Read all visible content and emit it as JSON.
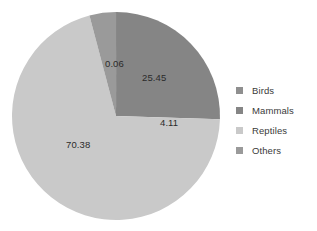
{
  "chart_data": {
    "type": "pie",
    "title": "",
    "subtitle": "",
    "xlabel": "",
    "ylabel": "",
    "grid": false,
    "legend_position": "right",
    "start_angle_deg": 0,
    "direction": "clockwise",
    "categories": [
      "Birds",
      "Mammals",
      "Reptiles",
      "Others"
    ],
    "values": [
      0.06,
      25.45,
      70.38,
      4.11
    ],
    "data_labels": [
      "0.06",
      "25.45",
      "70.38",
      "4.11"
    ],
    "colors": [
      "#8f8f8f",
      "#858585",
      "#c9c9c9",
      "#9a9a9a"
    ],
    "slices": [
      {
        "name": "Birds",
        "value": 0.06,
        "label": "0.06",
        "color": "#8f8f8f"
      },
      {
        "name": "Mammals",
        "value": 25.45,
        "label": "25.45",
        "color": "#858585"
      },
      {
        "name": "Reptiles",
        "value": 70.38,
        "label": "70.38",
        "color": "#c9c9c9"
      },
      {
        "name": "Others",
        "value": 4.11,
        "label": "4.11",
        "color": "#9a9a9a"
      }
    ]
  },
  "legend": {
    "items": [
      {
        "label": "Birds",
        "color": "#8f8f8f"
      },
      {
        "label": "Mammals",
        "color": "#858585"
      },
      {
        "label": "Reptiles",
        "color": "#c9c9c9"
      },
      {
        "label": "Others",
        "color": "#9a9a9a"
      }
    ]
  },
  "labels": {
    "birds": "0.06",
    "mammals": "25.45",
    "reptiles": "70.38",
    "others": "4.11"
  }
}
